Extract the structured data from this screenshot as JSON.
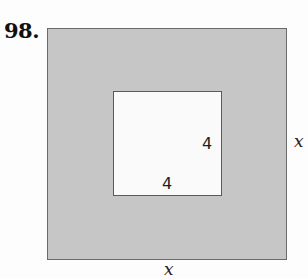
{
  "problem": {
    "number": "98."
  },
  "figure": {
    "outer_square": {
      "side_label_right": "x",
      "side_label_bottom": "x",
      "fill": "#c6c6c6"
    },
    "inner_square": {
      "side_label_right": "4",
      "side_label_bottom": "4",
      "fill": "#fafafa"
    }
  }
}
